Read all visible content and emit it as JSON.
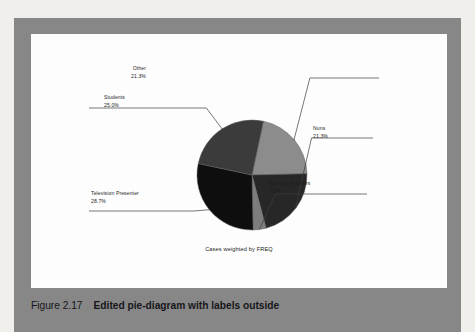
{
  "figure": {
    "number": "Figure 2.17",
    "title": "Edited pie-diagram with labels outside",
    "footnote": "Cases weighted by FREQ"
  },
  "colors": {
    "page_background": "#f1efec",
    "panel_band": "#878787",
    "chart_background": "#fdfdfd",
    "text": "#1d1d1d",
    "leader_line": "#3c3c3c",
    "slice_other": "#8c8c8c",
    "slice_nuns": "#272727",
    "slice_nursery_teachers": "#7d7d7d",
    "slice_television_presenter": "#0e0e0e",
    "slice_students": "#3b3b3b"
  },
  "chart_data": {
    "type": "pie",
    "title": "",
    "subtitle": "",
    "xlabel": "",
    "ylabel": "",
    "legend_position": "none",
    "grid": false,
    "labels_position": "outside",
    "annotation": "Cases weighted by FREQ",
    "categories": [
      "Other",
      "Nuns",
      "Nursery Teachers",
      "Television Presenter",
      "Students"
    ],
    "values": [
      21.3,
      21.3,
      3.8,
      28.7,
      25.0
    ],
    "value_unit": "percent",
    "slices": [
      {
        "label": "Other",
        "percent": "21.3%",
        "value": 21.3,
        "color": "#8c8c8c"
      },
      {
        "label": "Nuns",
        "percent": "21.3%",
        "value": 21.3,
        "color": "#272727"
      },
      {
        "label": "Nursery Teachers",
        "percent": "3.8%",
        "value": 3.8,
        "color": "#7d7d7d"
      },
      {
        "label": "Television Presenter",
        "percent": "28.7%",
        "value": 28.7,
        "color": "#0e0e0e"
      },
      {
        "label": "Students",
        "percent": "25.0%",
        "value": 25.0,
        "color": "#3b3b3b"
      }
    ]
  }
}
